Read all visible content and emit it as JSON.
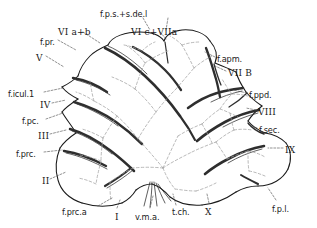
{
  "figure": {
    "type": "anatomical-line-drawing",
    "background": "#ffffff",
    "ink": "#1a1a1a",
    "fissure_stroke": "#2b2b2b",
    "dashed_stroke": "#9a9a9a",
    "outline_stroke": "#1a1a1a"
  },
  "labels": {
    "top": [
      {
        "id": "fps-sdel",
        "text": "f.p.s.+s.de.l",
        "x": 100,
        "y": 10,
        "style": "plain"
      },
      {
        "id": "vi-a-b",
        "text": "VI a+b",
        "x": 58,
        "y": 28,
        "style": "roman"
      },
      {
        "id": "vi-c-viia",
        "text": "VI c+VIIa",
        "x": 131,
        "y": 28,
        "style": "roman"
      }
    ],
    "left": [
      {
        "id": "f-pr",
        "text": "f.pr.",
        "x": 40,
        "y": 38,
        "style": "plain"
      },
      {
        "id": "v",
        "text": "V",
        "x": 36,
        "y": 54,
        "style": "roman"
      },
      {
        "id": "f-icul-1",
        "text": "f.icul.1",
        "x": 8,
        "y": 90,
        "style": "plain"
      },
      {
        "id": "iv",
        "text": "IV",
        "x": 40,
        "y": 101,
        "style": "roman"
      },
      {
        "id": "f-pc",
        "text": "f.pc.",
        "x": 22,
        "y": 117,
        "style": "plain"
      },
      {
        "id": "iii",
        "text": "III",
        "x": 38,
        "y": 132,
        "style": "roman"
      },
      {
        "id": "f-prc",
        "text": "f.prc.",
        "x": 16,
        "y": 150,
        "style": "plain"
      },
      {
        "id": "ii",
        "text": "II",
        "x": 42,
        "y": 177,
        "style": "roman"
      }
    ],
    "right": [
      {
        "id": "f-apm",
        "text": "f.apm.",
        "x": 217,
        "y": 55,
        "style": "plain"
      },
      {
        "id": "vii-b",
        "text": "VII B",
        "x": 228,
        "y": 69,
        "style": "roman"
      },
      {
        "id": "f-ppd",
        "text": "f.ppd.",
        "x": 249,
        "y": 91,
        "style": "plain"
      },
      {
        "id": "viii",
        "text": "VIII",
        "x": 258,
        "y": 108,
        "style": "roman"
      },
      {
        "id": "f-sec",
        "text": "f.sec.",
        "x": 259,
        "y": 126,
        "style": "plain"
      },
      {
        "id": "ix",
        "text": "IX",
        "x": 285,
        "y": 146,
        "style": "roman"
      }
    ],
    "bottom": [
      {
        "id": "f-prc-a",
        "text": "f.prc.a",
        "x": 62,
        "y": 208,
        "style": "plain"
      },
      {
        "id": "i",
        "text": "I",
        "x": 115,
        "y": 213,
        "style": "roman"
      },
      {
        "id": "v-m-a",
        "text": "v.m.a.",
        "x": 135,
        "y": 213,
        "style": "plain"
      },
      {
        "id": "t-ch",
        "text": "t.ch.",
        "x": 172,
        "y": 208,
        "style": "plain"
      },
      {
        "id": "x",
        "text": "X",
        "x": 205,
        "y": 208,
        "style": "roman"
      },
      {
        "id": "f-p-l",
        "text": "f.p.l.",
        "x": 272,
        "y": 205,
        "style": "plain"
      }
    ]
  },
  "legend_note": ""
}
